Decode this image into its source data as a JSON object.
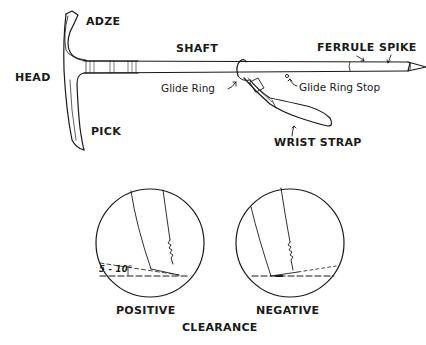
{
  "diagram": {
    "axe": {
      "labels": {
        "adze": "ADZE",
        "head": "HEAD",
        "pick": "PICK",
        "shaft": "SHAFT",
        "ferrule": "FERRULE",
        "spike": "SPIKE",
        "glide_ring": "Glide Ring",
        "glide_ring_stop": "Glide Ring Stop",
        "wrist_strap": "WRIST STRAP"
      }
    },
    "clearance": {
      "title": "CLEARANCE",
      "positive": {
        "label": "POSITIVE",
        "angle_annotation": "5 - 10°"
      },
      "negative": {
        "label": "NEGATIVE"
      }
    },
    "colors": {
      "ink": "#1a1a1a",
      "background": "#ffffff"
    }
  }
}
